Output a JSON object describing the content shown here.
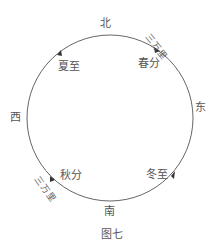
{
  "directions": {
    "north": "北",
    "south": "南",
    "east": "东",
    "west": "西"
  },
  "points": {
    "summer_solstice": "夏至",
    "spring_equinox": "春分",
    "autumn_equinox": "秋分",
    "winter_solstice": "冬至"
  },
  "distance_ne": "三万里",
  "distance_sw": "三万里",
  "caption": "图七",
  "colors": {
    "line": "#555555",
    "text": "#555555"
  }
}
